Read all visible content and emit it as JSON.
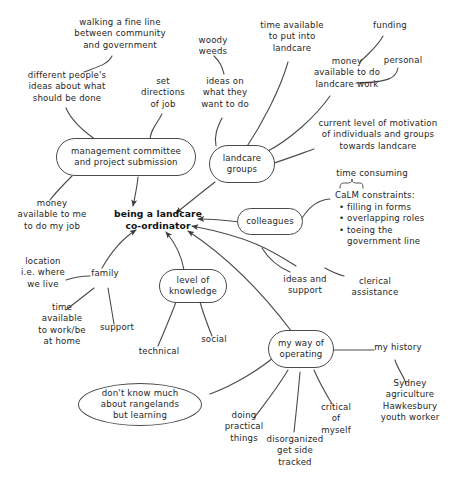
{
  "diagram": {
    "center": {
      "label": "being a landcare\nco-ordinator"
    },
    "nodes": [
      {
        "id": "management",
        "label": "management committee\nand project submission",
        "shape": "stadium"
      },
      {
        "id": "landcare_groups",
        "label": "landcare\ngroups",
        "shape": "rounded"
      },
      {
        "id": "colleagues",
        "label": "colleagues",
        "shape": "stadium"
      },
      {
        "id": "level_of_knowledge",
        "label": "level of\nknowledge",
        "shape": "rounded"
      },
      {
        "id": "my_way_of_operating",
        "label": "my way of\noperating",
        "shape": "rounded"
      },
      {
        "id": "rangelands",
        "label": "don't know much\nabout rangelands\nbut learning",
        "shape": "ellipse"
      }
    ],
    "labels": [
      {
        "id": "walking_fine_line",
        "text": "walking a fine line\nbetween community\nand government"
      },
      {
        "id": "woody_weeds",
        "text": "woody\nweeds"
      },
      {
        "id": "time_available_landcare",
        "text": "time available\nto put into\nlandcare"
      },
      {
        "id": "funding",
        "text": "funding"
      },
      {
        "id": "different_peoples_ideas",
        "text": "different people's\nideas about what\nshould be done"
      },
      {
        "id": "set_directions_of_job",
        "text": "set\ndirections\nof job"
      },
      {
        "id": "ideas_on_what_they_want",
        "text": "ideas on\nwhat they\nwant to do"
      },
      {
        "id": "money_landcare_work",
        "text": "money\navailable to do\nlandcare work"
      },
      {
        "id": "personal",
        "text": "personal"
      },
      {
        "id": "current_level_motivation",
        "text": "current level of motivation\nof individuals and groups\ntowards landcare"
      },
      {
        "id": "time_consuming",
        "text": "time consuming"
      },
      {
        "id": "money_available_to_me",
        "text": "money\navailable to me\nto do my job"
      },
      {
        "id": "location",
        "text": "location\ni.e. where\nwe live"
      },
      {
        "id": "family",
        "text": "family"
      },
      {
        "id": "ideas_and_support",
        "text": "ideas and\nsupport"
      },
      {
        "id": "clerical_assistance",
        "text": "clerical\nassistance"
      },
      {
        "id": "time_available_home",
        "text": "time\navailable\nto work/be\nat home"
      },
      {
        "id": "support",
        "text": "support"
      },
      {
        "id": "social",
        "text": "social"
      },
      {
        "id": "technical",
        "text": "technical"
      },
      {
        "id": "my_history",
        "text": "my history"
      },
      {
        "id": "doing_practical_things",
        "text": "doing\npractical\nthings"
      },
      {
        "id": "critical_of_myself",
        "text": "critical\nof\nmyself"
      },
      {
        "id": "sydney_agriculture",
        "text": "Sydney\nagriculture\nHawkesbury\nyouth worker"
      },
      {
        "id": "disorganized",
        "text": "disorganized\nget side\ntracked"
      }
    ],
    "calm_constraints": {
      "heading": "CaLM constraints:",
      "items": [
        "filling in forms",
        "overlapping roles",
        "toeing the",
        "government line"
      ]
    },
    "colors": {
      "background": "#ffffff",
      "stroke": "#4a4a4a",
      "text": "#262626",
      "center_text": "#111111"
    }
  }
}
